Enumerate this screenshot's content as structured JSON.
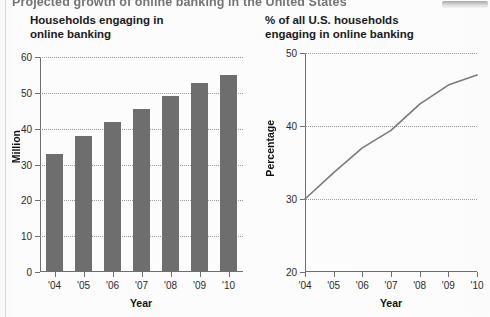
{
  "page": {
    "banner_headline": "Projected growth of online banking in the United States",
    "background_color": "#fdfdfd",
    "bar_color": "#6e6e6e",
    "line_color": "#7a7a7a",
    "axis_color": "#6f6f6f",
    "grid_color": "#9a9a9a"
  },
  "chart_data": [
    {
      "type": "bar",
      "title": "Households engaging in\nonline banking",
      "xlabel": "Year",
      "ylabel": "Million",
      "categories": [
        "'04",
        "'05",
        "'06",
        "'07",
        "'08",
        "'09",
        "'10"
      ],
      "values": [
        33,
        38,
        42,
        45.5,
        49,
        52.8,
        55
      ],
      "ylim": [
        0,
        60
      ],
      "yticks": [
        0,
        10,
        20,
        30,
        40,
        50,
        60
      ],
      "ytick_labels": [
        "0",
        "10",
        "20",
        "30",
        "40",
        "50",
        "60"
      ],
      "grid": true,
      "legend": "none"
    },
    {
      "type": "line",
      "title": "% of all U.S. households\nengaging in online banking",
      "xlabel": "Year",
      "ylabel": "Percentage",
      "categories": [
        "'04",
        "'05",
        "'06",
        "'07",
        "'08",
        "'09",
        "'10"
      ],
      "values": [
        30,
        33.6,
        37,
        39.4,
        43,
        45.6,
        47
      ],
      "ylim": [
        20,
        50
      ],
      "yticks": [
        20,
        30,
        40,
        50
      ],
      "ytick_labels": [
        "20",
        "30",
        "40",
        "50"
      ],
      "grid": true,
      "legend": "none"
    }
  ]
}
